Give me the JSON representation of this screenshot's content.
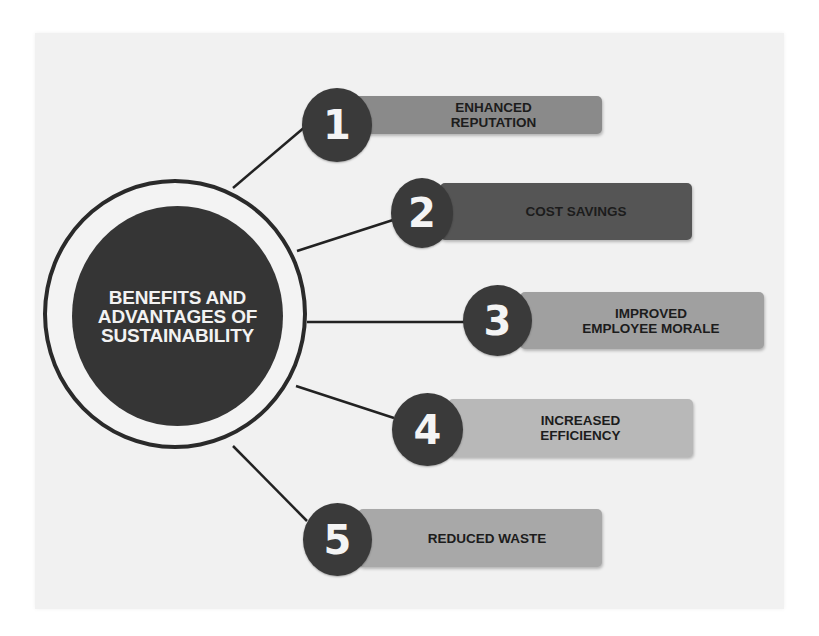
{
  "hub": {
    "title": "BENEFITS AND\nADVANTAGES OF\nSUSTAINABILITY"
  },
  "items": [
    {
      "number": "1",
      "label": "ENHANCED\nREPUTATION",
      "bar_color": "#8a8a8a"
    },
    {
      "number": "2",
      "label": "COST SAVINGS",
      "bar_color": "#555555"
    },
    {
      "number": "3",
      "label": "IMPROVED\nEMPLOYEE MORALE",
      "bar_color": "#a0a0a0"
    },
    {
      "number": "4",
      "label": "INCREASED\nEFFICIENCY",
      "bar_color": "#b8b8b8"
    },
    {
      "number": "5",
      "label": "REDUCED WASTE",
      "bar_color": "#a8a8a8"
    }
  ],
  "colors": {
    "background": "#f1f1f1",
    "hub_core": "#353535",
    "badge": "#3a3a3a",
    "connector": "#222222"
  }
}
